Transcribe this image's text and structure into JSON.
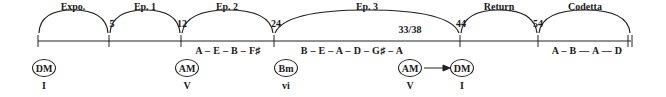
{
  "diagram": {
    "sections": [
      {
        "label": "Expo.",
        "x": 73
      },
      {
        "label": "Ep. 1",
        "x": 145
      },
      {
        "label": "Ep. 2",
        "x": 227
      },
      {
        "label": "Ep. 3",
        "x": 367
      },
      {
        "label": "Return",
        "x": 499
      },
      {
        "label": "Codetta",
        "x": 585
      }
    ],
    "measure_numbers": [
      {
        "label": "5",
        "x": 112
      },
      {
        "label": "12",
        "x": 182
      },
      {
        "label": "24",
        "x": 276
      },
      {
        "label": "33/38",
        "x": 410
      },
      {
        "label": "44",
        "x": 461
      },
      {
        "label": "54",
        "x": 538
      }
    ],
    "key_sequences": [
      {
        "label": "A – E – B – F♯",
        "x": 228
      },
      {
        "label": "B – E – A – D – G♯ – A",
        "x": 352
      },
      {
        "label": "A – B —   A  —   D",
        "x": 587
      }
    ],
    "keys": [
      {
        "label": "DM",
        "x": 44
      },
      {
        "label": "AM",
        "x": 187
      },
      {
        "label": "Bm",
        "x": 286
      },
      {
        "label": "AM",
        "x": 410
      },
      {
        "label": "DM",
        "x": 462
      }
    ],
    "roman_numerals": [
      {
        "label": "I",
        "x": 44
      },
      {
        "label": "V",
        "x": 187
      },
      {
        "label": "vi",
        "x": 286
      },
      {
        "label": "V",
        "x": 410
      },
      {
        "label": "I",
        "x": 462
      }
    ],
    "line_color": "#222222"
  }
}
